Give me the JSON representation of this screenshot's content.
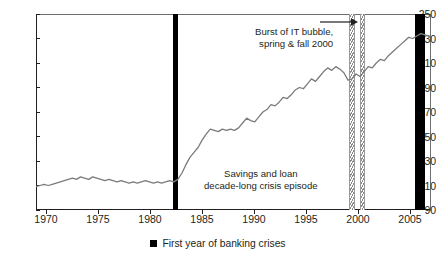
{
  "chart_data": {
    "type": "line",
    "title": "",
    "xlabel": "",
    "ylabel": "",
    "xlim": [
      1969,
      2008
    ],
    "ylim": [
      90,
      250
    ],
    "ytick_labels": [
      "250",
      "230",
      "210",
      "190",
      "170",
      "150",
      "130",
      "110",
      "90"
    ],
    "ytick_values": [
      250,
      230,
      210,
      190,
      170,
      150,
      130,
      110,
      90
    ],
    "xtick_labels": [
      "1970",
      "1975",
      "1980",
      "1985",
      "1990",
      "1995",
      "2000",
      "2005"
    ],
    "xtick_values": [
      1970,
      1975,
      1980,
      1985,
      1990,
      1995,
      2000,
      2005
    ],
    "grid": false,
    "legend_position": "bottom-center",
    "series": [
      {
        "name": "Real house price index",
        "color": "#7b7b7b",
        "x": [
          1969.0,
          1969.4,
          1969.8,
          1970.2,
          1970.6,
          1971.0,
          1971.4,
          1971.8,
          1972.2,
          1972.6,
          1973.0,
          1973.4,
          1973.8,
          1974.2,
          1974.6,
          1975.0,
          1975.4,
          1975.8,
          1976.2,
          1976.6,
          1977.0,
          1977.4,
          1977.8,
          1978.2,
          1978.6,
          1979.0,
          1979.4,
          1979.8,
          1980.2,
          1980.6,
          1981.0,
          1981.4,
          1981.8,
          1982.2,
          1982.6,
          1983.0,
          1983.4,
          1983.8,
          1984.2,
          1984.6,
          1985.0,
          1985.4,
          1985.8,
          1986.2,
          1986.6,
          1987.0,
          1987.4,
          1987.8,
          1988.2,
          1988.6,
          1989.0,
          1989.4,
          1989.8,
          1990.2,
          1990.6,
          1991.0,
          1991.4,
          1991.8,
          1992.2,
          1992.6,
          1993.0,
          1993.4,
          1993.8,
          1994.2,
          1994.6,
          1995.0,
          1995.4,
          1995.8,
          1996.2,
          1996.6,
          1997.0,
          1997.4,
          1997.8,
          1998.2,
          1998.6,
          1999.0,
          1999.4,
          1999.8,
          2000.2,
          2000.6,
          2001.0,
          2001.4,
          2001.8,
          2002.2,
          2002.6,
          2003.0,
          2003.4,
          2003.8,
          2004.2,
          2004.6,
          2005.0,
          2005.4,
          2005.8,
          2006.2,
          2006.6,
          2007.0,
          2007.4,
          2007.8
        ],
        "y": [
          109,
          110,
          111,
          110,
          111,
          112,
          113,
          114,
          115,
          116,
          115,
          117,
          116,
          115,
          117,
          116,
          115,
          114,
          115,
          114,
          113,
          114,
          113,
          112,
          113,
          112,
          113,
          114,
          113,
          112,
          113,
          112,
          113,
          114,
          113,
          115,
          120,
          127,
          133,
          137,
          141,
          147,
          152,
          156,
          155,
          154,
          156,
          155,
          156,
          155,
          157,
          161,
          165,
          163,
          162,
          166,
          170,
          172,
          176,
          175,
          178,
          182,
          181,
          184,
          188,
          190,
          189,
          193,
          197,
          195,
          199,
          203,
          206,
          204,
          207,
          205,
          202,
          196,
          197,
          201,
          199,
          203,
          207,
          206,
          210,
          213,
          212,
          216,
          219,
          222,
          225,
          228,
          231,
          230,
          232,
          234,
          233,
          232
        ]
      }
    ],
    "events": [
      {
        "name": "banking-crisis-1983",
        "kind": "solid",
        "x_start": 1982.55,
        "x_end": 1983.05,
        "color": "#000000"
      },
      {
        "name": "it-bubble-spring-2000",
        "kind": "hatch",
        "x_start": 1999.95,
        "x_end": 2000.45
      },
      {
        "name": "it-bubble-fall-2000",
        "kind": "hatch",
        "x_start": 2000.95,
        "x_end": 2001.45
      },
      {
        "name": "banking-crisis-2007",
        "kind": "solid",
        "x_start": 2006.4,
        "x_end": 2007.4,
        "color": "#000000"
      }
    ],
    "annotations": [
      {
        "name": "it-bubble-annotation",
        "line1": "Burst of IT bubble,",
        "line2": "spring & fall 2000"
      },
      {
        "name": "savings-loan-annotation",
        "line1": "Savings and loan",
        "line2": "decade-long crisis episode"
      }
    ],
    "legend": [
      {
        "label": "First year of banking crises",
        "color": "#000000",
        "marker": "square"
      }
    ]
  }
}
